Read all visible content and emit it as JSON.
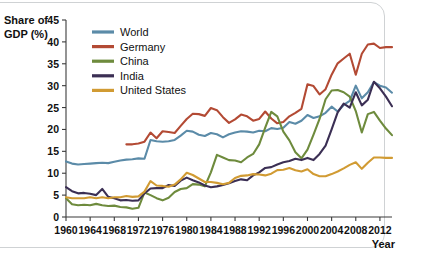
{
  "chart_data": {
    "type": "line",
    "title": "",
    "subtitle": "",
    "xlabel": "Year",
    "ylabel": "Share of GDP (%)",
    "ylabel_line1": "Share of",
    "ylabel_line2": "GDP (%)",
    "xlim": [
      1960,
      2014
    ],
    "ylim": [
      0,
      45
    ],
    "ytick_step": 5,
    "xtick_step": 4,
    "grid": false,
    "legend_position": "top-left inside plot",
    "yticks": [
      0,
      5,
      10,
      15,
      20,
      25,
      30,
      35,
      40,
      45
    ],
    "xticks": [
      1960,
      1964,
      1968,
      1972,
      1976,
      1980,
      1984,
      1988,
      1992,
      1996,
      2000,
      2004,
      2008,
      2012
    ],
    "xtick_labels": [
      "1960",
      "1964",
      "1968",
      "1972",
      "1976",
      "1980",
      "1984",
      "1988",
      "1992",
      "1996",
      "2000",
      "2004",
      "2008",
      "2012"
    ],
    "ytick_labels": [
      "0",
      "5",
      "10",
      "15",
      "20",
      "25",
      "30",
      "35",
      "40",
      "45"
    ],
    "series": [
      {
        "name": "World",
        "color": "#5B8BA8",
        "x": [
          1960,
          1961,
          1962,
          1963,
          1964,
          1965,
          1966,
          1967,
          1968,
          1969,
          1970,
          1971,
          1972,
          1973,
          1974,
          1975,
          1976,
          1977,
          1978,
          1979,
          1980,
          1981,
          1982,
          1983,
          1984,
          1985,
          1986,
          1987,
          1988,
          1989,
          1990,
          1991,
          1992,
          1993,
          1994,
          1995,
          1996,
          1997,
          1998,
          1999,
          2000,
          2001,
          2002,
          2003,
          2004,
          2005,
          2006,
          2007,
          2008,
          2009,
          2010,
          2011,
          2012,
          2013,
          2014
        ],
        "values": [
          12.7,
          12.2,
          12.0,
          12.1,
          12.2,
          12.3,
          12.4,
          12.3,
          12.6,
          12.9,
          13.1,
          13.2,
          13.4,
          13.3,
          17.6,
          17.3,
          17.2,
          17.3,
          17.6,
          18.6,
          19.7,
          19.5,
          18.8,
          18.5,
          19.2,
          18.9,
          18.2,
          18.9,
          19.3,
          19.6,
          19.5,
          19.3,
          19.7,
          19.6,
          20.3,
          20.1,
          20.4,
          21.7,
          21.3,
          22.0,
          23.3,
          22.6,
          23.0,
          23.8,
          25.2,
          24.1,
          25.6,
          26.5,
          30.0,
          27.1,
          28.5,
          30.8,
          30.0,
          29.6,
          28.4
        ]
      },
      {
        "name": "Germany",
        "color": "#B34A34",
        "x": [
          1970,
          1971,
          1972,
          1973,
          1974,
          1975,
          1976,
          1977,
          1978,
          1979,
          1980,
          1981,
          1982,
          1983,
          1984,
          1985,
          1986,
          1987,
          1988,
          1989,
          1990,
          1991,
          1992,
          1993,
          1994,
          1995,
          1996,
          1997,
          1998,
          1999,
          2000,
          2001,
          2002,
          2003,
          2004,
          2005,
          2006,
          2007,
          2008,
          2009,
          2010,
          2011,
          2012,
          2013,
          2014
        ],
        "values": [
          16.6,
          16.6,
          16.8,
          17.2,
          19.3,
          18.0,
          19.6,
          19.4,
          19.2,
          20.8,
          22.4,
          23.6,
          23.5,
          23.1,
          24.9,
          24.4,
          22.8,
          21.5,
          22.3,
          23.4,
          23.0,
          22.0,
          22.4,
          24.1,
          22.5,
          21.4,
          21.7,
          23.0,
          23.8,
          24.7,
          30.3,
          29.9,
          28.0,
          29.2,
          32.5,
          35.1,
          36.2,
          37.3,
          32.5,
          37.3,
          39.4,
          39.6,
          38.6,
          38.8,
          38.8
        ]
      },
      {
        "name": "China",
        "color": "#6E8B3D",
        "x": [
          1960,
          1961,
          1962,
          1963,
          1964,
          1965,
          1966,
          1967,
          1968,
          1969,
          1970,
          1971,
          1972,
          1973,
          1974,
          1975,
          1976,
          1977,
          1978,
          1979,
          1980,
          1981,
          1982,
          1983,
          1984,
          1985,
          1986,
          1987,
          1988,
          1989,
          1990,
          1991,
          1992,
          1993,
          1994,
          1995,
          1996,
          1997,
          1998,
          1999,
          2000,
          2001,
          2002,
          2003,
          2004,
          2005,
          2006,
          2007,
          2008,
          2009,
          2010,
          2011,
          2012,
          2013,
          2014
        ],
        "values": [
          4.3,
          2.9,
          2.7,
          2.8,
          2.7,
          3.0,
          2.7,
          2.5,
          2.6,
          2.3,
          2.2,
          1.9,
          2.1,
          5.6,
          5.0,
          4.3,
          3.8,
          4.4,
          5.7,
          6.4,
          6.6,
          7.5,
          7.4,
          7.0,
          10.2,
          14.2,
          13.6,
          13.0,
          12.9,
          12.5,
          13.6,
          14.4,
          16.6,
          20.4,
          24.0,
          23.0,
          19.5,
          17.5,
          14.8,
          13.4,
          15.4,
          18.8,
          22.4,
          26.9,
          28.9,
          29.0,
          28.5,
          27.5,
          24.2,
          19.3,
          23.5,
          24.0,
          22.0,
          20.2,
          18.7
        ]
      },
      {
        "name": "India",
        "color": "#3B2F54",
        "x": [
          1960,
          1961,
          1962,
          1963,
          1964,
          1965,
          1966,
          1967,
          1968,
          1969,
          1970,
          1971,
          1972,
          1973,
          1974,
          1975,
          1976,
          1977,
          1978,
          1979,
          1980,
          1981,
          1982,
          1983,
          1984,
          1985,
          1986,
          1987,
          1988,
          1989,
          1990,
          1991,
          1992,
          1993,
          1994,
          1995,
          1996,
          1997,
          1998,
          1999,
          2000,
          2001,
          2002,
          2003,
          2004,
          2005,
          2006,
          2007,
          2008,
          2009,
          2010,
          2011,
          2012,
          2013,
          2014
        ],
        "values": [
          6.8,
          5.9,
          5.4,
          5.5,
          5.3,
          5.0,
          6.4,
          4.6,
          4.3,
          3.8,
          3.9,
          3.7,
          3.8,
          5.4,
          6.5,
          6.6,
          6.6,
          7.3,
          7.1,
          8.3,
          9.0,
          8.4,
          7.9,
          7.2,
          6.8,
          7.0,
          7.3,
          7.7,
          8.2,
          8.6,
          8.4,
          9.5,
          10.2,
          11.2,
          11.4,
          12.0,
          12.5,
          12.8,
          13.3,
          13.0,
          13.5,
          13.0,
          14.4,
          16.3,
          20.0,
          23.9,
          25.9,
          25.0,
          28.5,
          25.5,
          26.8,
          30.9,
          29.4,
          27.5,
          25.3
        ]
      },
      {
        "name": "United States",
        "color": "#D19B33",
        "x": [
          1960,
          1961,
          1962,
          1963,
          1964,
          1965,
          1966,
          1967,
          1968,
          1969,
          1970,
          1971,
          1972,
          1973,
          1974,
          1975,
          1976,
          1977,
          1978,
          1979,
          1980,
          1981,
          1982,
          1983,
          1984,
          1985,
          1986,
          1987,
          1988,
          1989,
          1990,
          1991,
          1992,
          1993,
          1994,
          1995,
          1996,
          1997,
          1998,
          1999,
          2000,
          2001,
          2002,
          2003,
          2004,
          2005,
          2006,
          2007,
          2008,
          2009,
          2010,
          2011,
          2012,
          2013,
          2014
        ],
        "values": [
          4.5,
          4.3,
          4.3,
          4.3,
          4.5,
          4.3,
          4.5,
          4.3,
          4.5,
          4.5,
          4.8,
          4.6,
          4.7,
          5.8,
          8.2,
          7.2,
          7.1,
          6.9,
          7.4,
          8.6,
          10.1,
          9.6,
          8.8,
          8.0,
          8.0,
          7.8,
          7.5,
          7.8,
          8.9,
          9.4,
          9.5,
          9.8,
          9.7,
          9.5,
          9.9,
          10.7,
          10.8,
          11.2,
          10.7,
          10.4,
          10.9,
          9.8,
          9.3,
          9.3,
          9.8,
          10.4,
          11.1,
          11.9,
          12.5,
          11.0,
          12.4,
          13.6,
          13.6,
          13.5,
          13.5
        ]
      }
    ]
  },
  "legend": {
    "items": [
      {
        "label": "World",
        "color": "#5B8BA8"
      },
      {
        "label": "Germany",
        "color": "#B34A34"
      },
      {
        "label": "China",
        "color": "#6E8B3D"
      },
      {
        "label": "India",
        "color": "#3B2F54"
      },
      {
        "label": "United States",
        "color": "#D19B33"
      }
    ]
  },
  "axes": {
    "y_title_line1": "Share of",
    "y_title_line2": "GDP (%)",
    "x_title": "Year"
  }
}
